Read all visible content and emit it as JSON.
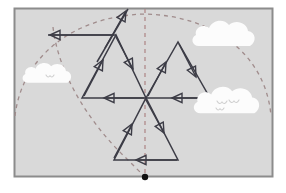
{
  "figure": {
    "type": "geometry-diagram",
    "canvas": {
      "width": 286,
      "height": 193
    }
  },
  "colors": {
    "page_background": "#ffffff",
    "panel_fill": "#d9d9d9",
    "panel_border": "#8c8c8c",
    "vector_stroke": "#3c3c46",
    "arc_dash": "#a08c8c",
    "axis_dash": "#b08a8a",
    "cloud_fill": "#fcfcfc",
    "bird_stroke": "#cfcfcf",
    "pivot_dot": "#111111"
  },
  "panel": {
    "name": "sky-panel",
    "x": 14,
    "y": 8,
    "width": 258,
    "height": 168,
    "border_width": 2
  },
  "pivot": {
    "name": "pivot-point",
    "x": 145,
    "y": 177,
    "radius": 3.2
  },
  "center": {
    "name": "convergence-point",
    "x": 146,
    "y": 98
  },
  "axis": {
    "name": "vertical-axis",
    "x": 145,
    "y_top": 9,
    "y_bottom": 177,
    "dash": "4 4",
    "width": 1.3
  },
  "arcs": [
    {
      "name": "outer-trajectory-arc",
      "path": "M 15 116 C 22 56, 74 16, 145 14 C 216 16, 266 56, 271 116",
      "dash": "4 4",
      "width": 1.3
    },
    {
      "name": "inner-trajectory-arc",
      "path": "M 53 27 C 58 72, 88 122, 126 158 C 133 165, 140 172, 145 177",
      "dash": "4 4",
      "width": 1.3
    }
  ],
  "triangles": [
    {
      "name": "triangle-upper-left",
      "points": "82,98 116,35 146,98",
      "apex": "116,35"
    },
    {
      "name": "triangle-upper-right",
      "points": "146,98 178,42 210,98",
      "apex": "178,42"
    },
    {
      "name": "triangle-lower-center",
      "points": "114,160 146,98 178,160",
      "apex": "146,98"
    }
  ],
  "vectors": [
    {
      "name": "vector-up-right-top",
      "label": "up-right arrow to top apex",
      "x1": 105,
      "y1": 48,
      "x2": 126,
      "y2": 11
    },
    {
      "name": "vector-left-upper",
      "label": "left-pointing horizontal arrow",
      "x1": 114,
      "y1": 35,
      "x2": 50,
      "y2": 35
    },
    {
      "name": "vector-up-left-inner",
      "label": "inner up-left arrow of left triangle",
      "x1": 84,
      "y1": 96,
      "x2": 103,
      "y2": 60
    },
    {
      "name": "vector-down-right-inner",
      "label": "inner down-right arrow of left triangle",
      "x1": 116,
      "y1": 37,
      "x2": 133,
      "y2": 69
    },
    {
      "name": "vector-left-center",
      "label": "left-pointing arrow on center horizontal",
      "x1": 144,
      "y1": 98,
      "x2": 104,
      "y2": 98
    },
    {
      "name": "vector-left-center-right",
      "label": "left-pointing arrow right of center",
      "x1": 208,
      "y1": 98,
      "x2": 172,
      "y2": 98
    },
    {
      "name": "vector-up-right-rt",
      "label": "up-right arrow of right triangle",
      "x1": 148,
      "y1": 96,
      "x2": 166,
      "y2": 62
    },
    {
      "name": "vector-down-right-rt",
      "label": "down-right arrow of right triangle",
      "x1": 179,
      "y1": 44,
      "x2": 196,
      "y2": 77
    },
    {
      "name": "vector-up-left-bottom",
      "label": "up-left arrow of bottom triangle",
      "x1": 114,
      "y1": 158,
      "x2": 132,
      "y2": 124
    },
    {
      "name": "vector-down-right-bottom",
      "label": "down-right arrow of bottom triangle",
      "x1": 146,
      "y1": 100,
      "x2": 164,
      "y2": 133
    },
    {
      "name": "vector-left-bottom",
      "label": "left-pointing arrow on bottom base",
      "x1": 177,
      "y1": 160,
      "x2": 136,
      "y2": 160
    }
  ],
  "clouds": [
    {
      "name": "cloud-upper-right",
      "cx": 225,
      "cy": 40,
      "scale": 1.0,
      "birds": []
    },
    {
      "name": "cloud-left",
      "cx": 48,
      "cy": 78,
      "scale": 0.78,
      "birds": [
        {
          "x": 50,
          "y": 75,
          "size": 4
        }
      ]
    },
    {
      "name": "cloud-right",
      "cx": 228,
      "cy": 107,
      "scale": 1.05,
      "birds": [
        {
          "x": 222,
          "y": 101,
          "size": 5
        },
        {
          "x": 234,
          "y": 100,
          "size": 5
        },
        {
          "x": 220,
          "y": 108,
          "size": 4
        }
      ]
    }
  ]
}
